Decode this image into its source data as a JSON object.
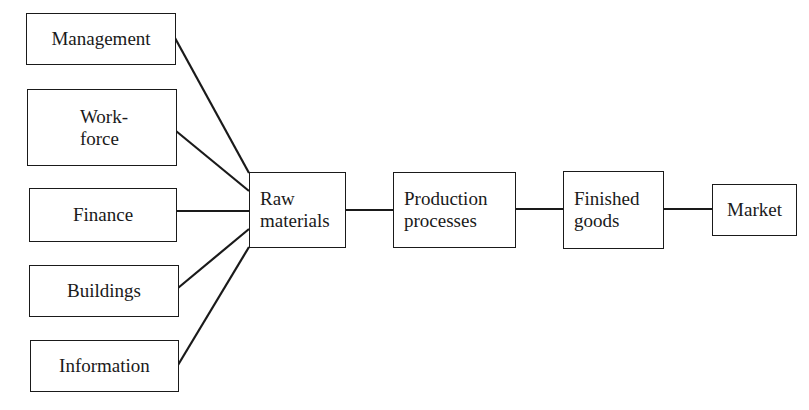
{
  "diagram": {
    "inputs": [
      {
        "id": "management",
        "label": "Management"
      },
      {
        "id": "workforce",
        "label": "Work-\nforce"
      },
      {
        "id": "finance",
        "label": "Finance"
      },
      {
        "id": "buildings",
        "label": "Buildings"
      },
      {
        "id": "information",
        "label": "Information"
      }
    ],
    "chain": [
      {
        "id": "raw-materials",
        "label": "Raw\nmaterials"
      },
      {
        "id": "production-processes",
        "label": "Production\nprocesses"
      },
      {
        "id": "finished-goods",
        "label": "Finished\ngoods"
      },
      {
        "id": "market",
        "label": "Market"
      }
    ],
    "edges": [
      [
        "management",
        "raw-materials"
      ],
      [
        "workforce",
        "raw-materials"
      ],
      [
        "finance",
        "raw-materials"
      ],
      [
        "buildings",
        "raw-materials"
      ],
      [
        "information",
        "raw-materials"
      ],
      [
        "raw-materials",
        "production-processes"
      ],
      [
        "production-processes",
        "finished-goods"
      ],
      [
        "finished-goods",
        "market"
      ]
    ],
    "colors": {
      "line": "#1a1a1a",
      "background": "#ffffff"
    }
  }
}
